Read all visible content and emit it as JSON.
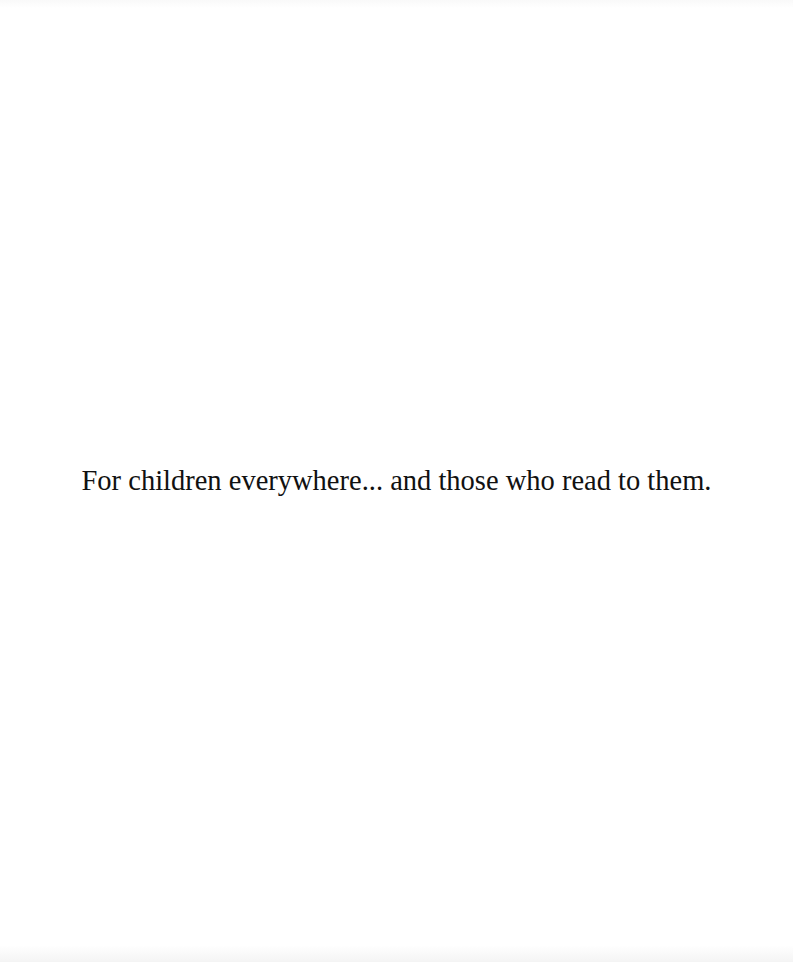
{
  "page": {
    "type": "dedication-page",
    "dedication_text": "For children everywhere... and those who read to them."
  },
  "colors": {
    "background": "#ffffff",
    "text": "#111111"
  }
}
